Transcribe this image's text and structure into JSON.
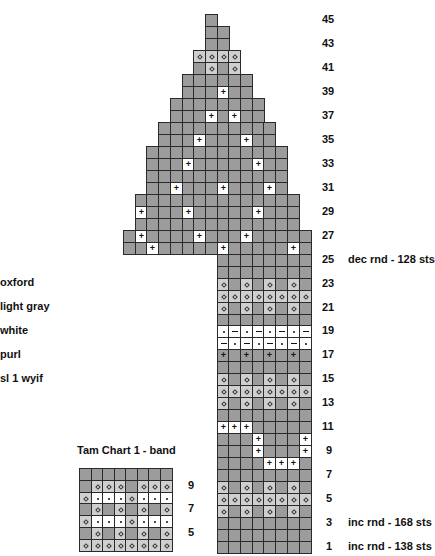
{
  "colors": {
    "dark_gray": "#9c9c9c",
    "light_gray": "#cfcfcf",
    "white": "#ffffff",
    "grid_line": "#2a2a2a"
  },
  "legend": [
    {
      "label": "oxford"
    },
    {
      "label": "light gray"
    },
    {
      "label": "white"
    },
    {
      "label": "purl"
    },
    {
      "label": "sl 1 wyif"
    }
  ],
  "main_chart": {
    "row_labels": [
      "45",
      "43",
      "41",
      "39",
      "37",
      "35",
      "33",
      "31",
      "29",
      "27",
      "25",
      "23",
      "21",
      "19",
      "17",
      "15",
      "13",
      "11",
      "9",
      "7",
      "5",
      "3",
      "1"
    ],
    "notes": [
      {
        "row": 25,
        "text": "dec rnd - 128 sts"
      },
      {
        "row": 3,
        "text": "inc rnd - 168 sts"
      },
      {
        "row": 1,
        "text": "inc rnd - 138 sts"
      }
    ],
    "symbol_key": {
      "g": "oxford (plain)",
      "o": "light gray",
      "w": "white",
      "+": "white purl",
      "P": "oxford purl",
      ".": "white sl 1 wyif dot",
      "-": "white purl dash"
    },
    "rows": [
      {
        "row": 45,
        "start": 7,
        "cells": "g"
      },
      {
        "row": 44,
        "start": 7,
        "cells": "gg"
      },
      {
        "row": 43,
        "start": 7,
        "cells": "gg"
      },
      {
        "row": 42,
        "start": 6,
        "cells": "oooo"
      },
      {
        "row": 41,
        "start": 6,
        "cells": "gogo"
      },
      {
        "row": 40,
        "start": 5,
        "cells": "gggggg"
      },
      {
        "row": 39,
        "start": 5,
        "cells": "ggg+gg"
      },
      {
        "row": 38,
        "start": 4,
        "cells": "gggggggg"
      },
      {
        "row": 37,
        "start": 4,
        "cells": "ggg+g+gg"
      },
      {
        "row": 36,
        "start": 3,
        "cells": "gggggggggg"
      },
      {
        "row": 35,
        "start": 3,
        "cells": "ggg+ggg+gg"
      },
      {
        "row": 34,
        "start": 2,
        "cells": "gggggggggggg"
      },
      {
        "row": 33,
        "start": 2,
        "cells": "ggg+ggggg+gg"
      },
      {
        "row": 32,
        "start": 2,
        "cells": "gggggggggggg"
      },
      {
        "row": 31,
        "start": 2,
        "cells": "gg+ggg+ggg+g"
      },
      {
        "row": 30,
        "start": 1,
        "cells": "gggggggggggggg"
      },
      {
        "row": 29,
        "start": 1,
        "cells": "+ggg+ggggg+ggg"
      },
      {
        "row": 28,
        "start": 1,
        "cells": "gggggggggggggg"
      },
      {
        "row": 27,
        "start": 0,
        "cells": "g+gggg+ggg+ggggg"
      },
      {
        "row": 26,
        "start": 0,
        "cells": "gg+ggggg+ggggg+g"
      },
      {
        "row": 25,
        "start": 8,
        "cells": "gggggggg"
      },
      {
        "row": 24,
        "start": 8,
        "cells": "gggggggg"
      },
      {
        "row": 23,
        "start": 8,
        "cells": "ogogogog"
      },
      {
        "row": 22,
        "start": 8,
        "cells": "oooooooo"
      },
      {
        "row": 21,
        "start": 8,
        "cells": "ogogogog"
      },
      {
        "row": 20,
        "start": 8,
        "cells": "gggggggg"
      },
      {
        "row": 19,
        "start": 8,
        "cells": ".-.-.-.-"
      },
      {
        "row": 18,
        "start": 8,
        "cells": "-.-.-.-."
      },
      {
        "row": 17,
        "start": 8,
        "cells": "PgPgPgPg"
      },
      {
        "row": 16,
        "start": 8,
        "cells": "gggggggg"
      },
      {
        "row": 15,
        "start": 8,
        "cells": "ogogogog"
      },
      {
        "row": 14,
        "start": 8,
        "cells": "oooooooo"
      },
      {
        "row": 13,
        "start": 8,
        "cells": "ogogogog"
      },
      {
        "row": 12,
        "start": 8,
        "cells": "gggggggg"
      },
      {
        "row": 11,
        "start": 8,
        "cells": "+++ggggg"
      },
      {
        "row": 10,
        "start": 8,
        "cells": "ggg+ggg+"
      },
      {
        "row": 9,
        "start": 8,
        "cells": "ggg+ggg+"
      },
      {
        "row": 8,
        "start": 8,
        "cells": "gggg+++g"
      },
      {
        "row": 7,
        "start": 8,
        "cells": "gggggggg"
      },
      {
        "row": 6,
        "start": 8,
        "cells": "ogogogog"
      },
      {
        "row": 5,
        "start": 8,
        "cells": "oooooooo"
      },
      {
        "row": 4,
        "start": 8,
        "cells": "ogogogog"
      },
      {
        "row": 3,
        "start": 8,
        "cells": "gggggggg"
      },
      {
        "row": 2,
        "start": 8,
        "cells": "gggggggg"
      },
      {
        "row": 1,
        "start": 8,
        "cells": "gggggggg"
      }
    ]
  },
  "band_chart": {
    "title": "Tam Chart 1 - band",
    "row_labels": [
      "9",
      "7",
      "5"
    ],
    "rows": [
      "gggggggg",
      "gooogooo",
      "o...o...",
      "gogogogo",
      "o...o...",
      "gogogogo",
      "oooooooo"
    ]
  }
}
